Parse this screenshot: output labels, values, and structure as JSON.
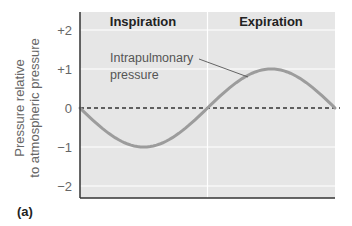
{
  "chart_data": {
    "type": "line",
    "title": "",
    "xlabel": "",
    "ylabel": "Pressure relative to atmospheric pressure",
    "ylabel_lines": [
      "Pressure relative",
      "to atmospheric pressure"
    ],
    "ylim": [
      -2.3,
      2.4
    ],
    "yticks": [
      2,
      1,
      0,
      -1,
      -2
    ],
    "ytick_labels": [
      "+2",
      "+1",
      "0",
      "−1",
      "−2"
    ],
    "grid": true,
    "phases": [
      {
        "label": "Inspiration",
        "x_start": 0,
        "x_end": 2
      },
      {
        "label": "Expiration",
        "x_start": 2,
        "x_end": 4
      }
    ],
    "series": [
      {
        "name": "Intrapulmonary pressure",
        "x": [
          0,
          0.5,
          1,
          1.5,
          2,
          2.5,
          3,
          3.5,
          4
        ],
        "values": [
          0,
          -0.71,
          -1,
          -0.71,
          0,
          0.71,
          1,
          0.71,
          0
        ]
      }
    ],
    "reference_line": {
      "y": 0,
      "style": "dashed"
    },
    "annotations": [
      {
        "text": "Intrapulmonary pressure",
        "lines": [
          "Intrapulmonary",
          "pressure"
        ],
        "points_to": {
          "x": 2.5,
          "y": 0.85
        }
      }
    ],
    "panel_label": "(a)"
  },
  "colors": {
    "plot_background": "#e6e6e6",
    "gridline": "#ffffff",
    "curve": "#9c9c9c",
    "axis": "#333333",
    "text": "#666666",
    "header_text": "#222222"
  }
}
